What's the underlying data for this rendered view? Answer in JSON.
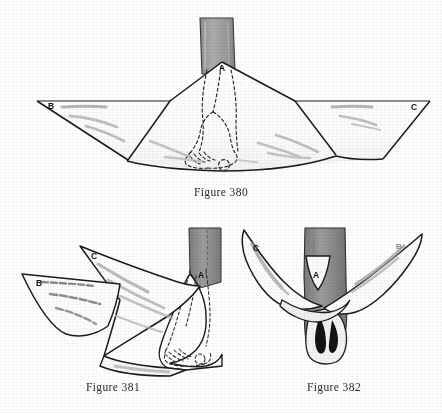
{
  "page": {
    "background_color": "#ffffff",
    "ink_color": "#1a1a1a",
    "shade_color": "#9a9a9a",
    "fold_color": "#b0b0b0"
  },
  "figures": [
    {
      "id": "figure-380",
      "caption": "Figure 380",
      "description": "Open triangular bandage spread flat beneath a foot, apex A above the instep, long base edge horizontal, corners B at left and C at right; hidden foot and toes shown in dashed outline.",
      "labels": [
        {
          "name": "point-a",
          "text": "A"
        },
        {
          "name": "point-b",
          "text": "B"
        },
        {
          "name": "point-c",
          "text": "C"
        }
      ]
    },
    {
      "id": "figure-381",
      "caption": "Figure 381",
      "description": "Three quarter view of the foot with apex A folded back over the instep and corners B and C drawn out to the sides.",
      "labels": [
        {
          "name": "point-a",
          "text": "A"
        },
        {
          "name": "point-b",
          "text": "B"
        },
        {
          "name": "point-c",
          "text": "C"
        }
      ]
    },
    {
      "id": "figure-382",
      "caption": "Figure 382",
      "description": "Front view of the ankle with apex A turned down over the instep and ends C and B crossed and carried around the ankle.",
      "labels": [
        {
          "name": "point-a",
          "text": "A"
        },
        {
          "name": "point-b",
          "text": "B"
        },
        {
          "name": "point-c",
          "text": "C"
        }
      ]
    }
  ]
}
